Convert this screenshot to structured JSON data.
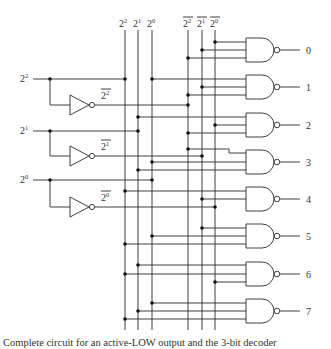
{
  "diagram": {
    "bus_labels": {
      "true": [
        {
          "base": "2",
          "exp": "2"
        },
        {
          "base": "2",
          "exp": "1"
        },
        {
          "base": "2",
          "exp": "0"
        }
      ],
      "complement": [
        {
          "base": "2",
          "exp": "2"
        },
        {
          "base": "2",
          "exp": "1"
        },
        {
          "base": "2",
          "exp": "0"
        }
      ]
    },
    "inputs": [
      {
        "base": "2",
        "exp": "2",
        "inverted_label_base": "2",
        "inverted_label_exp": "2"
      },
      {
        "base": "2",
        "exp": "1",
        "inverted_label_base": "2",
        "inverted_label_exp": "1"
      },
      {
        "base": "2",
        "exp": "0",
        "inverted_label_base": "2",
        "inverted_label_exp": "0"
      }
    ],
    "outputs": [
      "0",
      "1",
      "2",
      "3",
      "4",
      "5",
      "6",
      "7"
    ],
    "gate_type": "NAND (3-input)",
    "inverter_count": 3,
    "caption": "Complete circuit for an active-LOW output and the 3-bit decoder"
  }
}
